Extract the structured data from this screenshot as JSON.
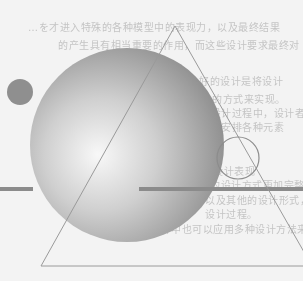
{
  "document": {
    "type": "scanned-page-illustration",
    "background_color": "#f3f3f3",
    "faint_text_lines": [
      {
        "text": "…を才进入特殊的各种模型中的表现力，以及最终结果",
        "x": 28,
        "y": 22
      },
      {
        "text": "的产生具有相当重要的作用，而这些设计要求最终对",
        "x": 58,
        "y": 40
      },
      {
        "text": "……所以说、实际上，一个好的设计是将设计",
        "x": 73,
        "y": 76
      },
      {
        "text": "的方式来实现。",
        "x": 212,
        "y": 94
      },
      {
        "text": "在设计过程中，设计者能够理解",
        "x": 200,
        "y": 108
      },
      {
        "text": "合理安排各种元素",
        "x": 200,
        "y": 122
      },
      {
        "text": "……然后进行设计表现",
        "x": 150,
        "y": 166
      },
      {
        "text": "的设计方式更加完整",
        "x": 210,
        "y": 180
      },
      {
        "text": "以及其他的设计形式，也是",
        "x": 205,
        "y": 195
      },
      {
        "text": "设计过程。",
        "x": 205,
        "y": 209
      },
      {
        "text": "设计中也可以应用多种设计方法来实现设计目的",
        "x": 150,
        "y": 224
      }
    ]
  },
  "shapes": {
    "sphere": {
      "cx": 127,
      "cy": 145,
      "r": 97,
      "highlight": "#f8f8f8",
      "mid": "#cfcfcf",
      "edge": "#8d8d8d"
    },
    "small_circle": {
      "cx": 20,
      "cy": 92,
      "r": 13,
      "fill": "#8f8f8f"
    },
    "triangle": {
      "apex": [
        175,
        26
      ],
      "left": [
        41,
        266
      ],
      "right": [
        312,
        266
      ],
      "stroke": "#9a9a9a"
    },
    "outline_circle": {
      "cx": 238,
      "cy": 158,
      "r": 21,
      "stroke": "#8c8c8c"
    },
    "bars": [
      {
        "x1": 0,
        "x2": 33,
        "y": 189,
        "thickness": 4,
        "color": "#8b8b8b"
      },
      {
        "x1": 139,
        "x2": 303,
        "y": 189,
        "thickness": 4,
        "color": "#8b8b8b"
      }
    ]
  }
}
